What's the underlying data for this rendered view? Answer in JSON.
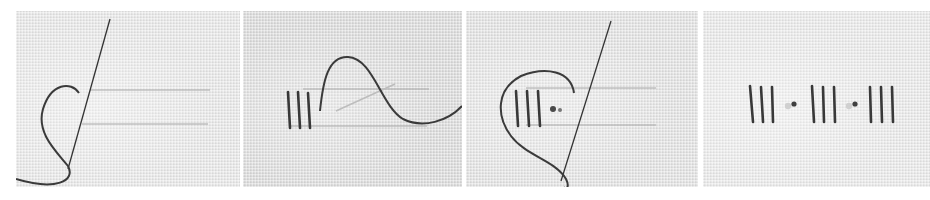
{
  "image": {
    "description": "Four-step embroidery stitch tutorial photographed on light grey evenweave linen",
    "background": "#ffffff",
    "thread_color": "#3a3a3a",
    "fabric_colors": [
      "#e8e8e8",
      "#dcdcdc",
      "#e3e3e3",
      "#eaeaea"
    ]
  },
  "panels": [
    {
      "step": 1,
      "content": "Needle emerges through fabric beside two parallel guide lines; working thread loops to the left"
    },
    {
      "step": 2,
      "content": "Three vertical straight stitches completed; needle passes under thread which arcs over to the right"
    },
    {
      "step": 3,
      "content": "Three vertical bars with a small knot beside them; needle re-enters while thread loops around"
    },
    {
      "step": 4,
      "content": "Finished band: three groups of three vertical bars separated by two small knots"
    }
  ]
}
